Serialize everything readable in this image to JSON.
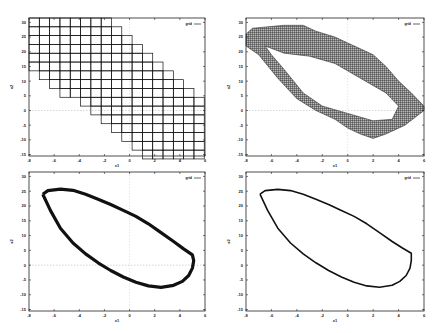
{
  "chart_data": [
    {
      "type": "scatter",
      "panel": "top-left",
      "title": "",
      "xlabel": "x1",
      "ylabel": "x2",
      "xlim": [
        -8,
        6
      ],
      "ylim": [
        -15.5,
        31.5
      ],
      "xticks": [
        -8,
        -6,
        -4,
        -2,
        0,
        2,
        4,
        6
      ],
      "yticks": [
        30,
        25,
        20,
        15,
        10,
        5,
        0,
        -5,
        -10,
        -15
      ],
      "legend": {
        "label": "grid",
        "placement": "top-right"
      },
      "grid": false,
      "zero_lines": true,
      "style": "coarse-grid",
      "grid_cells": {
        "cell_width": 0.82,
        "cell_height": 3.0,
        "x0": -8,
        "rows": [
          {
            "y_top": 31.5,
            "col_start": 0,
            "col_end": 7
          },
          {
            "y_top": 28.5,
            "col_start": 0,
            "col_end": 8
          },
          {
            "y_top": 25.5,
            "col_start": 0,
            "col_end": 9
          },
          {
            "y_top": 22.5,
            "col_start": 0,
            "col_end": 10
          },
          {
            "y_top": 19.5,
            "col_start": 0,
            "col_end": 11
          },
          {
            "y_top": 16.5,
            "col_start": 0,
            "col_end": 12
          },
          {
            "y_top": 13.5,
            "col_start": 1,
            "col_end": 13
          },
          {
            "y_top": 10.5,
            "col_start": 2,
            "col_end": 14
          },
          {
            "y_top": 7.5,
            "col_start": 3,
            "col_end": 15
          },
          {
            "y_top": 4.5,
            "col_start": 5,
            "col_end": 16
          },
          {
            "y_top": 1.5,
            "col_start": 6,
            "col_end": 16
          },
          {
            "y_top": -1.5,
            "col_start": 7,
            "col_end": 16
          },
          {
            "y_top": -4.5,
            "col_start": 8,
            "col_end": 16
          },
          {
            "y_top": -7.5,
            "col_start": 9,
            "col_end": 16
          },
          {
            "y_top": -10.5,
            "col_start": 10,
            "col_end": 16
          },
          {
            "y_top": -13.5,
            "col_start": 11,
            "col_end": 16
          }
        ]
      }
    },
    {
      "type": "scatter",
      "panel": "top-right",
      "title": "",
      "xlabel": "x1",
      "ylabel": "x2",
      "xlim": [
        -8,
        6
      ],
      "ylim": [
        -15.5,
        31.5
      ],
      "xticks": [
        -8,
        -6,
        -4,
        -2,
        0,
        2,
        4,
        6
      ],
      "yticks": [
        30,
        25,
        20,
        15,
        10,
        5,
        0,
        -5,
        -10,
        -15
      ],
      "legend": {
        "label": "grid",
        "placement": "top-right"
      },
      "grid": false,
      "zero_lines": true,
      "style": "fine-grid-annulus",
      "outer_boundary": [
        [
          -8,
          26
        ],
        [
          -7.5,
          28
        ],
        [
          -5,
          29
        ],
        [
          -3.5,
          29
        ],
        [
          -2.5,
          27
        ],
        [
          -1,
          25
        ],
        [
          0,
          23
        ],
        [
          1,
          21
        ],
        [
          2,
          19
        ],
        [
          3,
          15
        ],
        [
          4,
          10
        ],
        [
          5,
          6
        ],
        [
          6,
          1.5
        ],
        [
          6,
          0
        ],
        [
          4.5,
          -5
        ],
        [
          3,
          -8
        ],
        [
          2,
          -9.5
        ],
        [
          1,
          -8
        ],
        [
          0,
          -6
        ],
        [
          -1,
          -3
        ],
        [
          -2.5,
          0
        ],
        [
          -4,
          4
        ],
        [
          -5.5,
          11
        ],
        [
          -7,
          19
        ],
        [
          -8,
          22
        ]
      ],
      "inner_boundary": [
        [
          -6.5,
          22
        ],
        [
          -5,
          19.5
        ],
        [
          -3,
          18.5
        ],
        [
          -1,
          16
        ],
        [
          1,
          11
        ],
        [
          3,
          6
        ],
        [
          4,
          1.5
        ],
        [
          3.5,
          -3
        ],
        [
          2,
          -3.5
        ],
        [
          0,
          -1
        ],
        [
          -2,
          1.5
        ],
        [
          -3.5,
          6
        ],
        [
          -5,
          14
        ],
        [
          -6,
          19
        ]
      ]
    },
    {
      "type": "line",
      "panel": "bottom-left",
      "title": "",
      "xlabel": "x1",
      "ylabel": "x2",
      "xlim": [
        -8,
        6
      ],
      "ylim": [
        -15.5,
        31.5
      ],
      "xticks": [
        -8,
        -6,
        -4,
        -2,
        0,
        2,
        4,
        6
      ],
      "yticks": [
        30,
        25,
        20,
        15,
        10,
        5,
        0,
        -5,
        -10,
        -15
      ],
      "legend": {
        "label": "grid",
        "placement": "top-right"
      },
      "grid": false,
      "zero_lines": true,
      "style": "thick-cycle",
      "x": [
        -6.9,
        -6.5,
        -5.5,
        -4.5,
        -3.5,
        -2.5,
        -1.5,
        -0.5,
        0.5,
        1.5,
        2.5,
        3.5,
        4.3,
        5.0,
        5.1,
        5.0,
        4.7,
        4.2,
        3.5,
        2.5,
        1.5,
        0.5,
        -0.5,
        -1.5,
        -2.5,
        -3.5,
        -4.5,
        -5.5,
        -6.3,
        -6.9
      ],
      "y": [
        24,
        25.2,
        25.7,
        25.3,
        24.0,
        22.3,
        20.5,
        18.5,
        16.5,
        14.0,
        11.0,
        8.0,
        5.5,
        3.5,
        1.5,
        -1.0,
        -3.5,
        -5.5,
        -6.8,
        -7.5,
        -7.0,
        -5.8,
        -4.0,
        -1.8,
        0.8,
        3.8,
        7.5,
        12.5,
        18.5,
        24
      ]
    },
    {
      "type": "line",
      "panel": "bottom-right",
      "title": "",
      "xlabel": "x1",
      "ylabel": "x2",
      "xlim": [
        -8,
        6
      ],
      "ylim": [
        -15.5,
        31.5
      ],
      "xticks": [
        -8,
        -6,
        -4,
        -2,
        0,
        2,
        4,
        6
      ],
      "yticks": [
        30,
        25,
        20,
        15,
        10,
        5,
        0,
        -5,
        -10,
        -15
      ],
      "legend": {
        "label": "grid",
        "placement": "top-right"
      },
      "grid": false,
      "zero_lines": false,
      "style": "thin-cycle",
      "x": [
        -6.9,
        -6.5,
        -5.5,
        -4.5,
        -3.5,
        -2.5,
        -1.5,
        -0.5,
        0.5,
        1.5,
        2.5,
        3.5,
        4.3,
        5.0,
        5.0,
        4.9,
        4.6,
        4.1,
        3.5,
        2.5,
        1.5,
        0.5,
        -0.5,
        -1.5,
        -2.5,
        -3.5,
        -4.5,
        -5.5,
        -6.3,
        -6.9
      ],
      "y": [
        24,
        25.2,
        25.6,
        25.2,
        24.0,
        22.3,
        20.5,
        18.5,
        16.5,
        14.0,
        11.0,
        8.0,
        5.8,
        4.0,
        1.5,
        -1.0,
        -3.5,
        -5.5,
        -6.8,
        -7.5,
        -7.0,
        -5.8,
        -4.0,
        -1.8,
        0.8,
        3.8,
        7.5,
        12.5,
        18.5,
        24
      ]
    }
  ]
}
